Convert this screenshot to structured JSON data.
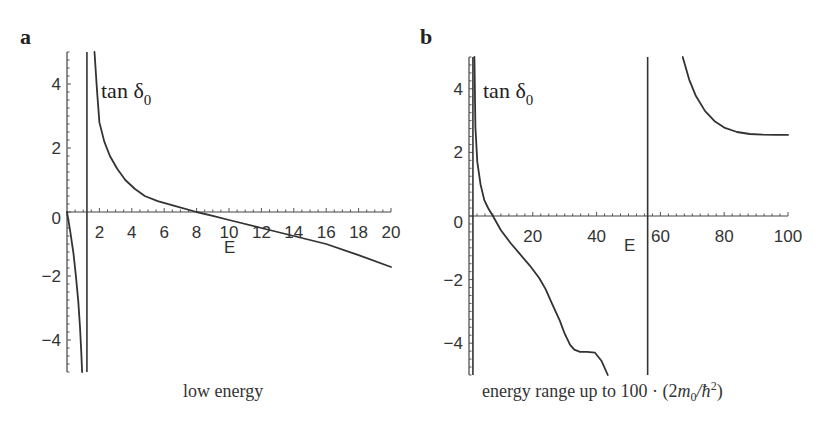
{
  "figure": {
    "panels": [
      {
        "id": "a",
        "letter": "a",
        "caption": "low energy",
        "series_label": "tan δ",
        "series_label_sub": "0",
        "xlabel": "E",
        "xticks": [
          "2",
          "4",
          "6",
          "8",
          "10",
          "12",
          "14",
          "16",
          "18",
          "20"
        ],
        "yticks": [
          "4",
          "2",
          "0",
          "−2",
          "−4"
        ]
      },
      {
        "id": "b",
        "letter": "b",
        "caption": "energy range up to 100 · (2m₀/ħ²)",
        "caption_parts": {
          "prefix": "energy range up to 100 · (2",
          "m": "m",
          "m_sub": "0",
          "slash": "/ħ",
          "sup": "2",
          "suffix": ")"
        },
        "series_label": "tan δ",
        "series_label_sub": "0",
        "xlabel": "E",
        "xticks": [
          "20",
          "40",
          "60",
          "80",
          "100"
        ],
        "yticks": [
          "4",
          "2",
          "0",
          "−2",
          "−4"
        ]
      }
    ]
  },
  "chart_data": [
    {
      "type": "line",
      "title": "a",
      "caption": "low energy",
      "xlabel": "E",
      "ylabel": "tan δ0",
      "xlim": [
        0,
        20
      ],
      "ylim": [
        -5,
        5
      ],
      "xticks": [
        2,
        4,
        6,
        8,
        10,
        12,
        14,
        16,
        18,
        20
      ],
      "yticks": [
        -4,
        -2,
        0,
        2,
        4
      ],
      "grid": false,
      "asymptotes_x": [
        1.23
      ],
      "series": [
        {
          "name": "tan δ0 (branch 1)",
          "x": [
            0.0,
            0.2,
            0.4,
            0.55,
            0.7,
            0.8,
            0.88,
            0.93
          ],
          "y": [
            0.0,
            -0.6,
            -1.3,
            -2.0,
            -2.8,
            -3.6,
            -4.4,
            -5.0
          ]
        },
        {
          "name": "tan δ0 (branch 2)",
          "x": [
            1.7,
            1.85,
            2.0,
            2.3,
            2.65,
            3.1,
            3.6,
            4.2,
            4.8,
            5.6,
            6.7,
            8.0,
            9.0,
            10.0,
            12.0,
            14.0,
            16.0,
            18.0,
            20.0
          ],
          "y": [
            5.0,
            3.8,
            2.8,
            2.2,
            1.75,
            1.35,
            1.0,
            0.72,
            0.5,
            0.34,
            0.18,
            0.0,
            -0.12,
            -0.25,
            -0.5,
            -0.75,
            -1.0,
            -1.35,
            -1.72
          ]
        }
      ]
    },
    {
      "type": "line",
      "title": "b",
      "caption": "energy range up to 100 · (2m0/ħ²)",
      "xlabel": "E",
      "ylabel": "tan δ0",
      "xlim": [
        0,
        100
      ],
      "ylim": [
        -5,
        5
      ],
      "xticks": [
        20,
        40,
        60,
        80,
        100
      ],
      "yticks": [
        -4,
        -2,
        0,
        2,
        4
      ],
      "grid": false,
      "asymptotes_x": [
        1.23,
        56.0
      ],
      "series": [
        {
          "name": "tan δ0 (branch 2)",
          "x": [
            1.7,
            2.0,
            2.6,
            3.6,
            4.8,
            6.0,
            7.5,
            10.0,
            13.0,
            16.0,
            19.0,
            22.0,
            24.0,
            26.0,
            28.5,
            30.0,
            31.7,
            33.0,
            34.8,
            37.0,
            39.5,
            41.5,
            43.5
          ],
          "y": [
            5.0,
            2.8,
            1.7,
            1.0,
            0.5,
            0.25,
            0.0,
            -0.45,
            -0.85,
            -1.2,
            -1.55,
            -1.95,
            -2.3,
            -2.75,
            -3.3,
            -3.7,
            -4.05,
            -4.2,
            -4.27,
            -4.27,
            -4.3,
            -4.55,
            -5.0
          ]
        },
        {
          "name": "tan δ0 (branch 3)",
          "x": [
            67.0,
            69.0,
            71.0,
            74.0,
            77.0,
            80.0,
            84.0,
            88.0,
            92.0,
            96.0,
            100.0
          ],
          "y": [
            5.0,
            4.3,
            3.8,
            3.3,
            2.98,
            2.78,
            2.64,
            2.58,
            2.56,
            2.55,
            2.55
          ]
        }
      ]
    }
  ]
}
